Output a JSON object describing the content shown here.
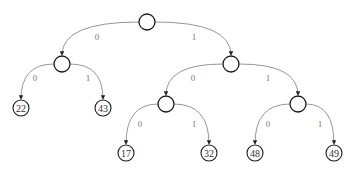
{
  "diagram": {
    "type": "binary-tree",
    "colors": {
      "node_stroke": "#1a1a1a",
      "edge": "#8a8a8a",
      "label": "#777777"
    },
    "nodes": [
      {
        "id": "root",
        "x": 147,
        "y": 22,
        "r": 8,
        "leaf": false,
        "label": ""
      },
      {
        "id": "n0",
        "x": 62,
        "y": 64,
        "r": 8,
        "leaf": false,
        "label": ""
      },
      {
        "id": "n1",
        "x": 231,
        "y": 64,
        "r": 8,
        "leaf": false,
        "label": ""
      },
      {
        "id": "n00",
        "x": 21,
        "y": 108,
        "r": 8,
        "leaf": true,
        "label": "22"
      },
      {
        "id": "n01",
        "x": 103,
        "y": 108,
        "r": 8,
        "leaf": true,
        "label": "43"
      },
      {
        "id": "n10",
        "x": 166,
        "y": 104,
        "r": 8,
        "leaf": false,
        "label": ""
      },
      {
        "id": "n11",
        "x": 298,
        "y": 104,
        "r": 8,
        "leaf": false,
        "label": ""
      },
      {
        "id": "n100",
        "x": 126,
        "y": 153,
        "r": 8,
        "leaf": true,
        "label": "17"
      },
      {
        "id": "n101",
        "x": 209,
        "y": 153,
        "r": 8,
        "leaf": true,
        "label": "32"
      },
      {
        "id": "n110",
        "x": 255,
        "y": 153,
        "r": 8,
        "leaf": true,
        "label": "48"
      },
      {
        "id": "n111",
        "x": 334,
        "y": 153,
        "r": 8,
        "leaf": true,
        "label": "49"
      }
    ],
    "edges": [
      {
        "from": "root",
        "to": "n0",
        "label": "0",
        "lx": 97,
        "ly": 40
      },
      {
        "from": "root",
        "to": "n1",
        "label": "1",
        "lx": 194,
        "ly": 40
      },
      {
        "from": "n0",
        "to": "n00",
        "label": "0",
        "lx": 35,
        "ly": 81
      },
      {
        "from": "n0",
        "to": "n01",
        "label": "1",
        "lx": 88,
        "ly": 81
      },
      {
        "from": "n1",
        "to": "n10",
        "label": "0",
        "lx": 193,
        "ly": 81
      },
      {
        "from": "n1",
        "to": "n11",
        "label": "1",
        "lx": 268,
        "ly": 81
      },
      {
        "from": "n10",
        "to": "n100",
        "label": "0",
        "lx": 140,
        "ly": 127
      },
      {
        "from": "n10",
        "to": "n101",
        "label": "1",
        "lx": 194,
        "ly": 127
      },
      {
        "from": "n11",
        "to": "n110",
        "label": "0",
        "lx": 268,
        "ly": 127
      },
      {
        "from": "n11",
        "to": "n111",
        "label": "1",
        "lx": 320,
        "ly": 127
      }
    ]
  }
}
